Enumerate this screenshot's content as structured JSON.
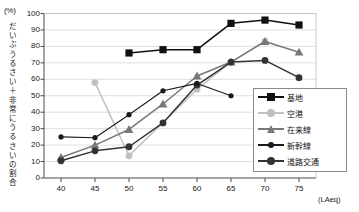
{
  "chart_data": {
    "type": "line",
    "title": "",
    "xlabel": "(LAeq)",
    "ylabel": "だいぶうるさい＋非常にうるさいの割合",
    "yunit": "(%)",
    "x": [
      40,
      45,
      50,
      55,
      60,
      65,
      70,
      75
    ],
    "xticks": [
      "40",
      "45",
      "50",
      "55",
      "60",
      "65",
      "70",
      "75"
    ],
    "yticks": [
      "0",
      "10",
      "20",
      "30",
      "40",
      "50",
      "60",
      "70",
      "80",
      "90",
      "100"
    ],
    "xlim": [
      37.5,
      77.5
    ],
    "ylim": [
      0,
      100
    ],
    "grid": true,
    "legend_position": "inside-right-lower",
    "series": [
      {
        "name": "基地",
        "color": "#111111",
        "marker": "square",
        "x": [
          50,
          55,
          60,
          65,
          70,
          75
        ],
        "values": [
          76,
          78,
          78,
          94,
          96,
          93
        ]
      },
      {
        "name": "空港",
        "color": "#c0c0c0",
        "marker": "circle",
        "x": [
          45,
          50,
          60,
          65,
          70
        ],
        "values": [
          58,
          13.5,
          54,
          70.5,
          83
        ]
      },
      {
        "name": "在来線",
        "color": "#787878",
        "marker": "triangle",
        "x": [
          40,
          45,
          50,
          55,
          60,
          65,
          70,
          75
        ],
        "values": [
          12.5,
          20,
          29.5,
          45,
          62,
          70.5,
          83,
          76.5
        ]
      },
      {
        "name": "新幹線",
        "color": "#1a1a1a",
        "marker": "small-circle",
        "x": [
          40,
          45,
          50,
          55,
          60,
          65
        ],
        "values": [
          25,
          24.5,
          38.5,
          53,
          57.5,
          50
        ]
      },
      {
        "name": "道路交通",
        "color": "#333333",
        "marker": "circle",
        "x": [
          40,
          45,
          50,
          55,
          60,
          65,
          70,
          75
        ],
        "values": [
          10.5,
          16.5,
          19,
          33.5,
          56.5,
          70.5,
          71.5,
          61
        ]
      }
    ]
  },
  "legend": {
    "items": [
      {
        "label": "基地"
      },
      {
        "label": "空港"
      },
      {
        "label": "在来線"
      },
      {
        "label": "新幹線"
      },
      {
        "label": "道路交通"
      }
    ]
  }
}
